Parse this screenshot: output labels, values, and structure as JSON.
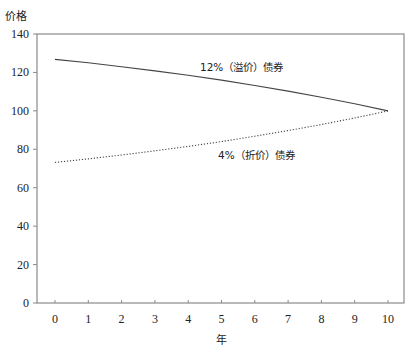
{
  "chart_data": {
    "type": "line",
    "title": "",
    "xlabel": "年",
    "ylabel": "价格",
    "x": [
      0,
      1,
      2,
      3,
      4,
      5,
      6,
      7,
      8,
      9,
      10
    ],
    "xticks": [
      "0",
      "1",
      "2",
      "3",
      "4",
      "5",
      "6",
      "7",
      "8",
      "9",
      "10"
    ],
    "yticks": [
      "0",
      "20",
      "40",
      "60",
      "80",
      "100",
      "120",
      "140"
    ],
    "xlim": [
      -0.55,
      10.5
    ],
    "ylim": [
      0,
      140
    ],
    "grid": false,
    "legend": "inline-annotations",
    "series": [
      {
        "name": "12%（溢价）债券",
        "style": "solid",
        "values": [
          126.8,
          125.0,
          123.0,
          120.8,
          118.5,
          116.0,
          113.2,
          110.3,
          107.1,
          103.7,
          100.0
        ]
      },
      {
        "name": "4%（折价）债券",
        "style": "dotted",
        "values": [
          73.2,
          75.0,
          77.0,
          79.2,
          81.5,
          84.0,
          86.8,
          89.7,
          92.9,
          96.3,
          100.0
        ]
      }
    ],
    "annotations": [
      {
        "text": "12%（溢价）债券",
        "series": 0
      },
      {
        "text": "4%（折价）债券",
        "series": 1
      }
    ]
  },
  "colors": {
    "axis": "#8a8a8a",
    "line": "#444444",
    "text": "#222222"
  }
}
